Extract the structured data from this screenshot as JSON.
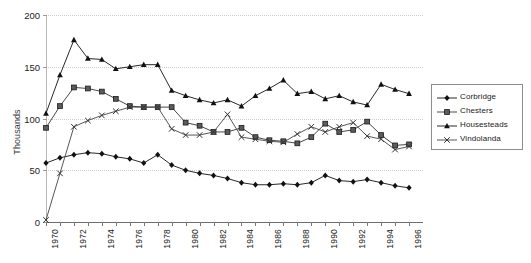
{
  "chart_data": {
    "type": "line",
    "title": "",
    "xlabel": "",
    "ylabel": "Thousands",
    "ylim": [
      0,
      200
    ],
    "yticks": [
      0,
      50,
      100,
      150,
      200
    ],
    "grid": true,
    "legend_position": "right",
    "x": [
      1970,
      1971,
      1972,
      1973,
      1974,
      1975,
      1976,
      1977,
      1978,
      1979,
      1980,
      1981,
      1982,
      1983,
      1984,
      1985,
      1986,
      1987,
      1988,
      1989,
      1990,
      1991,
      1992,
      1993,
      1994,
      1995,
      1996
    ],
    "xtick_labels": [
      "1970",
      "1972",
      "1974",
      "1976",
      "1978",
      "1980",
      "1982",
      "1984",
      "1986",
      "1988",
      "1990",
      "1992",
      "1994",
      "1996"
    ],
    "series": [
      {
        "name": "Corbridge",
        "marker": "diamond",
        "color": "#111111",
        "values": [
          57,
          62,
          65,
          67,
          66,
          63,
          61,
          57,
          65,
          55,
          50,
          47,
          45,
          42,
          38,
          36,
          36,
          37,
          36,
          38,
          45,
          40,
          39,
          41,
          38,
          35,
          33
        ]
      },
      {
        "name": "Chesters",
        "marker": "square",
        "color": "#333333",
        "values": [
          91,
          112,
          130,
          129,
          126,
          119,
          112,
          111,
          111,
          111,
          96,
          93,
          87,
          87,
          91,
          82,
          79,
          78,
          76,
          82,
          95,
          87,
          89,
          97,
          84,
          74,
          75
        ]
      },
      {
        "name": "Housesteads",
        "marker": "triangle",
        "color": "#111111",
        "values": [
          105,
          142,
          176,
          158,
          157,
          148,
          150,
          152,
          152,
          127,
          122,
          118,
          115,
          118,
          112,
          122,
          129,
          137,
          124,
          126,
          119,
          122,
          116,
          113,
          133,
          128,
          124
        ]
      },
      {
        "name": "Vindolanda",
        "marker": "cross",
        "color": "#444444",
        "values": [
          2,
          47,
          92,
          98,
          103,
          107,
          111,
          111,
          111,
          90,
          84,
          84,
          87,
          104,
          82,
          80,
          78,
          77,
          85,
          92,
          87,
          92,
          96,
          83,
          80,
          70,
          73
        ]
      }
    ]
  },
  "legend": {
    "items": [
      {
        "label": "Corbridge"
      },
      {
        "label": "Chesters"
      },
      {
        "label": "Housesteads"
      },
      {
        "label": "Vindolanda"
      }
    ]
  }
}
